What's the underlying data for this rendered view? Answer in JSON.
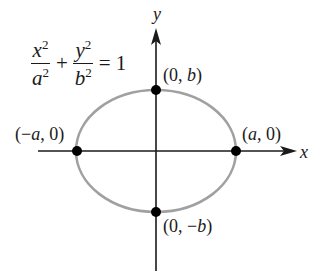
{
  "diagram": {
    "equation": {
      "term1_num": "x",
      "term1_num_exp": "2",
      "term1_den": "a",
      "term1_den_exp": "2",
      "plus": "+",
      "term2_num": "y",
      "term2_num_exp": "2",
      "term2_den": "b",
      "term2_den_exp": "2",
      "equals": "=",
      "rhs": "1"
    },
    "axes": {
      "x_label": "x",
      "y_label": "y"
    },
    "points": [
      {
        "id": "top-vertex",
        "label_open": "(0, ",
        "label_var": "b",
        "label_close": ")"
      },
      {
        "id": "bottom-vertex",
        "label_open": "(0, −",
        "label_var": "b",
        "label_close": ")"
      },
      {
        "id": "left-vertex",
        "label_open": "(−",
        "label_var": "a",
        "label_close": ", 0)"
      },
      {
        "id": "right-vertex",
        "label_open": "(",
        "label_var": "a",
        "label_close": ", 0)"
      }
    ],
    "colors": {
      "ellipse": "#a0a0a0",
      "axes": "#1a1a1a",
      "points": "#000000",
      "background": "#ffffff"
    }
  }
}
